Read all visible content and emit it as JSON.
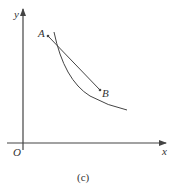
{
  "diagram": {
    "axes": {
      "x_label": "x",
      "y_label": "y",
      "origin_label": "O"
    },
    "points": [
      {
        "label": "A",
        "x": 48,
        "y": 36
      },
      {
        "label": "B",
        "x": 100,
        "y": 90
      }
    ],
    "caption": "(c)",
    "colors": {
      "stroke": "#444444",
      "text": "#333333"
    }
  }
}
